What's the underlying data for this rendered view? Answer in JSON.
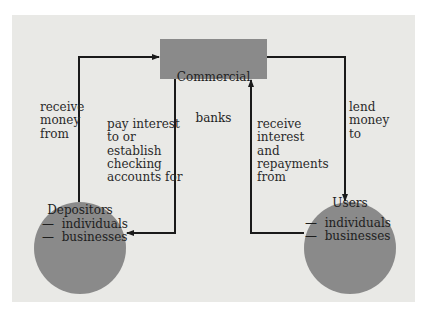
{
  "diagram": {
    "colors": {
      "background": "#e9e9e6",
      "node_fill": "#8a8a8a",
      "arrow": "#1a1a1a",
      "text": "#2a2a2a"
    },
    "nodes": {
      "banks": {
        "label_line1": "Commercial",
        "label_line2": "banks"
      },
      "depositors": {
        "title": "Depositors",
        "items": [
          "individuals",
          "businesses"
        ],
        "bullet": "—"
      },
      "users": {
        "title": "Users",
        "items": [
          "individuals",
          "businesses"
        ],
        "bullet": "—"
      }
    },
    "edges": {
      "depositors_to_banks": {
        "label": "receive\nmoney\nfrom"
      },
      "banks_to_depositors": {
        "label": "pay interest\nto or\nestablish\nchecking\naccounts for"
      },
      "users_to_banks": {
        "label": "receive\ninterest\nand\nrepayments\nfrom"
      },
      "banks_to_users": {
        "label": "lend\nmoney\nto"
      }
    }
  }
}
